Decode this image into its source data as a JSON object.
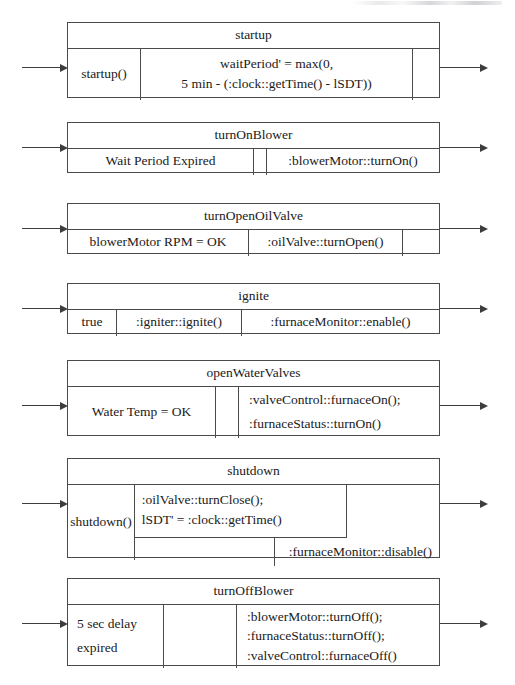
{
  "diagram": {
    "blocks": [
      {
        "name": "startup",
        "guard": "startup()",
        "actions": "waitPeriod' = max(0,\n5 min - (:clock::getTime() - lSDT))",
        "trailing": ""
      },
      {
        "name": "turnOnBlower",
        "guard": "Wait Period Expired",
        "spacer": "",
        "actions": ":blowerMotor::turnOn()"
      },
      {
        "name": "turnOpenOilValve",
        "guard": "blowerMotor RPM = OK",
        "actions": ":oilValve::turnOpen()",
        "trailing": ""
      },
      {
        "name": "ignite",
        "guard": "true",
        "actions": ":igniter::ignite()",
        "actions2": ":furnaceMonitor::enable()"
      },
      {
        "name": "openWaterValves",
        "guard": "Water Temp = OK",
        "spacer": "",
        "actions": ":valveControl::furnaceOn();\n:furnaceStatus::turnOn()"
      },
      {
        "name": "shutdown",
        "guard": "shutdown()",
        "actions": ":oilValve::turnClose();\nlSDT' = :clock::getTime()",
        "actions2": ":furnaceMonitor::disable()"
      },
      {
        "name": "turnOffBlower",
        "guard": "5 sec delay\nexpired",
        "spacer": "",
        "actions": ":blowerMotor::turnOff();\n:furnaceStatus::turnOff();\n:valveControl::furnaceOff()"
      }
    ]
  },
  "style": {
    "line_color": "#4a4a4a",
    "arrow_color": "#3d3d3d",
    "page_background": "#ffffff"
  }
}
